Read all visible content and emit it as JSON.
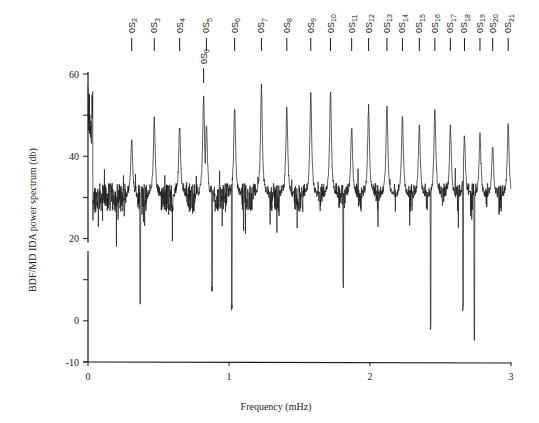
{
  "chart_data": {
    "type": "line",
    "title": "",
    "xlabel": "Frequency (mHz)",
    "ylabel": "BDF/MD IDA  power  spectrum  (db)",
    "xlim": [
      0,
      3
    ],
    "ylim": [
      -10,
      60
    ],
    "x_ticks": [
      0,
      1,
      2,
      3
    ],
    "x_tick_labels": [
      "0",
      "1",
      "2",
      "3"
    ],
    "y_ticks": [
      -10,
      0,
      10,
      20,
      30,
      40,
      50,
      60
    ],
    "y_tick_labels": [
      "-10",
      "0",
      "",
      "20",
      "",
      "40",
      "",
      "60"
    ],
    "grid": false,
    "legend": null,
    "baseline_db": 30,
    "noise_db": 3.5,
    "low_freq_peak": {
      "freq": 0.02,
      "db": 57
    },
    "mode_peaks": [
      {
        "label": "0S0",
        "base": "0S",
        "sub": "0",
        "freq": 0.82,
        "db": 55,
        "label_row": "lower"
      },
      {
        "label": "0S2",
        "base": "0S",
        "sub": "2",
        "freq": 0.31,
        "db": 44,
        "label_row": "upper"
      },
      {
        "label": "0S3",
        "base": "0S",
        "sub": "3",
        "freq": 0.47,
        "db": 49,
        "label_row": "upper"
      },
      {
        "label": "0S4",
        "base": "0S",
        "sub": "4",
        "freq": 0.65,
        "db": 47,
        "label_row": "upper"
      },
      {
        "label": "0S5",
        "base": "0S",
        "sub": "5",
        "freq": 0.84,
        "db": 48,
        "label_row": "upper"
      },
      {
        "label": "0S6",
        "base": "0S",
        "sub": "6",
        "freq": 1.04,
        "db": 52,
        "label_row": "upper"
      },
      {
        "label": "0S7",
        "base": "0S",
        "sub": "7",
        "freq": 1.23,
        "db": 57,
        "label_row": "upper"
      },
      {
        "label": "0S8",
        "base": "0S",
        "sub": "8",
        "freq": 1.41,
        "db": 52,
        "label_row": "upper"
      },
      {
        "label": "0S9",
        "base": "0S",
        "sub": "9",
        "freq": 1.58,
        "db": 55,
        "label_row": "upper"
      },
      {
        "label": "0S10",
        "base": "0S",
        "sub": "10",
        "freq": 1.72,
        "db": 56,
        "label_row": "upper"
      },
      {
        "label": "0S11",
        "base": "0S",
        "sub": "11",
        "freq": 1.87,
        "db": 47,
        "label_row": "upper"
      },
      {
        "label": "0S12",
        "base": "0S",
        "sub": "12",
        "freq": 1.99,
        "db": 52,
        "label_row": "upper"
      },
      {
        "label": "0S13",
        "base": "0S",
        "sub": "13",
        "freq": 2.12,
        "db": 52,
        "label_row": "upper"
      },
      {
        "label": "0S14",
        "base": "0S",
        "sub": "14",
        "freq": 2.23,
        "db": 50,
        "label_row": "upper"
      },
      {
        "label": "0S15",
        "base": "0S",
        "sub": "15",
        "freq": 2.35,
        "db": 48,
        "label_row": "upper"
      },
      {
        "label": "0S16",
        "base": "0S",
        "sub": "16",
        "freq": 2.46,
        "db": 52,
        "label_row": "upper"
      },
      {
        "label": "0S17",
        "base": "0S",
        "sub": "17",
        "freq": 2.57,
        "db": 47,
        "label_row": "upper"
      },
      {
        "label": "0S18",
        "base": "0S",
        "sub": "18",
        "freq": 2.67,
        "db": 45,
        "label_row": "upper"
      },
      {
        "label": "0S19",
        "base": "0S",
        "sub": "19",
        "freq": 2.78,
        "db": 45,
        "label_row": "upper"
      },
      {
        "label": "0S20",
        "base": "0S",
        "sub": "20",
        "freq": 2.87,
        "db": 43,
        "label_row": "upper"
      },
      {
        "label": "0S21",
        "base": "0S",
        "sub": "21",
        "freq": 2.98,
        "db": 48,
        "label_row": "upper"
      }
    ],
    "deep_troughs": [
      {
        "freq": 0.37,
        "db": 4
      },
      {
        "freq": 0.88,
        "db": 7
      },
      {
        "freq": 1.02,
        "db": 2
      },
      {
        "freq": 1.81,
        "db": 8
      },
      {
        "freq": 2.43,
        "db": -3
      },
      {
        "freq": 2.66,
        "db": 2
      },
      {
        "freq": 2.74,
        "db": -5
      }
    ]
  },
  "layout": {
    "plot_left_px": 88,
    "plot_right_px": 511,
    "y60_px": 74,
    "yneg10_px": 362,
    "line_color": "#1a1a1a"
  }
}
